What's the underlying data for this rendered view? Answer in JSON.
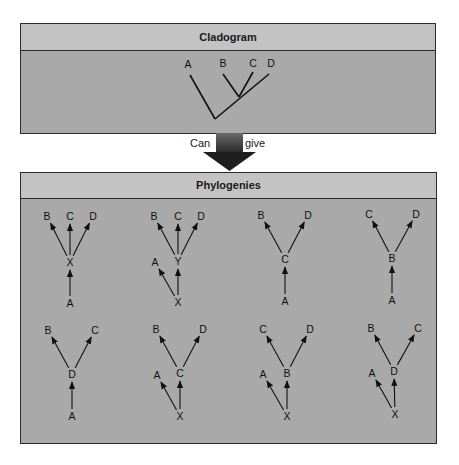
{
  "colors": {
    "panel_body": "#a9a9a9",
    "panel_header": "#c3c3c3",
    "border": "#2b2b2b",
    "line": "#111111",
    "arrow_dark": "#1e1e1e",
    "arrow_shaft": "#4a4a4a"
  },
  "cladogram": {
    "title": "Cladogram",
    "root": [
      215,
      119
    ],
    "internal_node": [
      239,
      97
    ],
    "tips": [
      {
        "label": "A",
        "tip": [
          190,
          75
        ],
        "label_pos": [
          188,
          68
        ],
        "parent": "root"
      },
      {
        "label": "B",
        "tip": [
          223,
          74
        ],
        "label_pos": [
          223,
          67
        ],
        "parent": "internal"
      },
      {
        "label": "C",
        "tip": [
          253,
          72
        ],
        "label_pos": [
          253,
          67
        ],
        "parent": "internal"
      },
      {
        "label": "D",
        "tip": [
          269,
          74
        ],
        "label_pos": [
          271,
          67
        ],
        "parent": "root_via_internal"
      }
    ]
  },
  "connector": {
    "left_label": "Can",
    "right_label": "give"
  },
  "phylogenies": {
    "title": "Phylogenies",
    "trees": [
      {
        "nodes": {
          "B": [
            47,
            220
          ],
          "C": [
            70,
            220
          ],
          "D": [
            93,
            220
          ],
          "X": [
            70,
            266
          ],
          "A": [
            70,
            307
          ]
        },
        "edges": [
          [
            "X",
            "B"
          ],
          [
            "X",
            "C"
          ],
          [
            "X",
            "D"
          ],
          [
            "A",
            "X"
          ]
        ]
      },
      {
        "nodes": {
          "B": [
            154,
            220
          ],
          "C": [
            178,
            220
          ],
          "D": [
            201,
            220
          ],
          "Y": [
            178,
            265
          ],
          "A": [
            155,
            266
          ],
          "X": [
            178,
            306
          ]
        },
        "edges": [
          [
            "Y",
            "B"
          ],
          [
            "Y",
            "C"
          ],
          [
            "Y",
            "D"
          ],
          [
            "X",
            "Y"
          ],
          [
            "X",
            "A"
          ]
        ]
      },
      {
        "nodes": {
          "B": [
            261,
            219
          ],
          "D": [
            308,
            219
          ],
          "C": [
            285,
            263
          ],
          "A": [
            285,
            305
          ]
        },
        "edges": [
          [
            "C",
            "B"
          ],
          [
            "C",
            "D"
          ],
          [
            "A",
            "C"
          ]
        ]
      },
      {
        "nodes": {
          "C": [
            369,
            218
          ],
          "D": [
            416,
            218
          ],
          "B": [
            392,
            262
          ],
          "A": [
            392,
            304
          ]
        },
        "edges": [
          [
            "B",
            "C"
          ],
          [
            "B",
            "D"
          ],
          [
            "A",
            "B"
          ]
        ]
      },
      {
        "nodes": {
          "B": [
            48,
            334
          ],
          "C": [
            95,
            334
          ],
          "D": [
            72,
            378
          ],
          "A": [
            72,
            420
          ]
        },
        "edges": [
          [
            "D",
            "B"
          ],
          [
            "D",
            "C"
          ],
          [
            "A",
            "D"
          ]
        ]
      },
      {
        "nodes": {
          "B": [
            156,
            333
          ],
          "D": [
            203,
            333
          ],
          "C": [
            180,
            377
          ],
          "A": [
            157,
            379
          ],
          "X": [
            180,
            420
          ]
        },
        "edges": [
          [
            "C",
            "B"
          ],
          [
            "C",
            "D"
          ],
          [
            "X",
            "C"
          ],
          [
            "X",
            "A"
          ]
        ]
      },
      {
        "nodes": {
          "C": [
            263,
            333
          ],
          "D": [
            310,
            333
          ],
          "B": [
            287,
            377
          ],
          "A": [
            263,
            378
          ],
          "X": [
            287,
            420
          ]
        },
        "edges": [
          [
            "B",
            "C"
          ],
          [
            "B",
            "D"
          ],
          [
            "X",
            "B"
          ],
          [
            "X",
            "A"
          ]
        ]
      },
      {
        "nodes": {
          "B": [
            371,
            332
          ],
          "C": [
            418,
            332
          ],
          "D": [
            394,
            375
          ],
          "A": [
            372,
            377
          ],
          "X": [
            395,
            418
          ]
        },
        "edges": [
          [
            "D",
            "B"
          ],
          [
            "D",
            "C"
          ],
          [
            "X",
            "D"
          ],
          [
            "X",
            "A"
          ]
        ]
      }
    ]
  }
}
